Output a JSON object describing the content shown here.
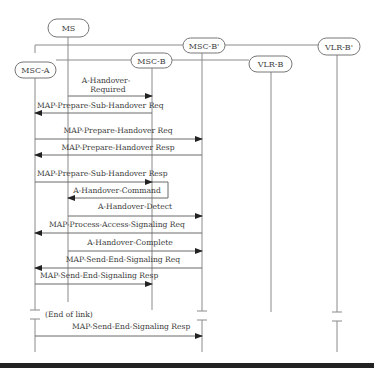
{
  "entities": [
    {
      "id": "ms",
      "label": "MS"
    },
    {
      "id": "msc_a",
      "label": "MSC-A"
    },
    {
      "id": "msc_b",
      "label": "MSC-B"
    },
    {
      "id": "msc_b2",
      "label": "MSC-B'"
    },
    {
      "id": "vlr_b",
      "label": "VLR-B"
    },
    {
      "id": "vlr_b2",
      "label": "VLR-B'"
    }
  ],
  "messages": [
    {
      "label": "A-Handover-Required",
      "label_lines": [
        "A-Handover-",
        "Required"
      ],
      "from": "ms",
      "to": "msc_b"
    },
    {
      "label": "MAP-Prepare-Sub-Handover Req",
      "from": "msc_b",
      "to": "msc_a"
    },
    {
      "label": "MAP-Prepare-Handover Req",
      "from": "msc_a",
      "to": "msc_b2"
    },
    {
      "label": "MAP-Prepare-Handover Resp",
      "from": "msc_b2",
      "to": "msc_a"
    },
    {
      "label": "MAP-Prepare-Sub-Handover Resp",
      "from": "msc_a",
      "to": "msc_b"
    },
    {
      "label": "A-Handover-Command",
      "from": "msc_b",
      "to": "ms"
    },
    {
      "label": "A-Handover-Detect",
      "from": "ms",
      "to": "msc_b2"
    },
    {
      "label": "MAP-Process-Access-Signaling Req",
      "from": "msc_b2",
      "to": "msc_a"
    },
    {
      "label": "A-Handover-Complete",
      "from": "ms",
      "to": "msc_b2"
    },
    {
      "label": "MAP-Send-End-Signaling Req",
      "from": "msc_b2",
      "to": "msc_a"
    },
    {
      "label": "MAP-Send-End-Signaling Resp",
      "from": "msc_a",
      "to": "msc_b"
    },
    {
      "label": "MAP-Send-End-Signaling Resp",
      "from": "msc_a",
      "to": "msc_b2"
    }
  ],
  "annotations": {
    "end_of_link": "(End of link)"
  }
}
